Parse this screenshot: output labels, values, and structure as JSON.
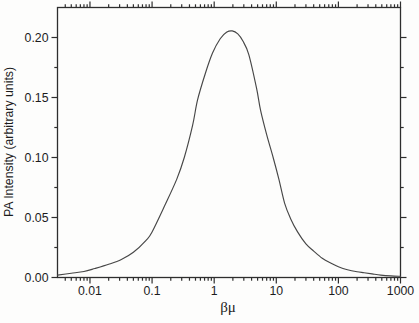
{
  "figure": {
    "background": "#fdfdfc",
    "axis_color": "#2e2e2e",
    "curve_color": "#474747",
    "text_color": "#1c1c1c"
  },
  "chart_data": {
    "type": "line",
    "title": "",
    "xlabel": "βμ",
    "ylabel": "PA Intensity (arbitrary units)",
    "x_scale": "log",
    "xlim": [
      0.003,
      1000
    ],
    "ylim": [
      0,
      0.225
    ],
    "grid": false,
    "legend": "none",
    "box_axes": true,
    "tick_direction": "out",
    "x_major_ticks": [
      0.01,
      0.1,
      1,
      10,
      100,
      1000
    ],
    "x_tick_labels": [
      "0.01",
      "0.1",
      "1",
      "10",
      "100",
      "1000"
    ],
    "y_major_ticks": [
      0,
      0.05,
      0.1,
      0.15,
      0.2
    ],
    "y_tick_labels": [
      "0.00",
      "0.05",
      "0.10",
      "0.15",
      "0.20"
    ],
    "y_minor_ticks": [
      0.025,
      0.075,
      0.125,
      0.175
    ],
    "peak": {
      "x": 1.9,
      "y": 0.205
    },
    "series": [
      {
        "name": "PA intensity",
        "points": [
          [
            0.003,
            0.002
          ],
          [
            0.005,
            0.0035
          ],
          [
            0.008,
            0.005
          ],
          [
            0.012,
            0.0075
          ],
          [
            0.02,
            0.011
          ],
          [
            0.032,
            0.015
          ],
          [
            0.05,
            0.021
          ],
          [
            0.08,
            0.031
          ],
          [
            0.1,
            0.038
          ],
          [
            0.16,
            0.06
          ],
          [
            0.25,
            0.082
          ],
          [
            0.33,
            0.1
          ],
          [
            0.45,
            0.127
          ],
          [
            0.54,
            0.148
          ],
          [
            0.72,
            0.17
          ],
          [
            0.94,
            0.187
          ],
          [
            1.25,
            0.199
          ],
          [
            1.6,
            0.2045
          ],
          [
            1.95,
            0.2055
          ],
          [
            2.4,
            0.203
          ],
          [
            2.9,
            0.197
          ],
          [
            3.6,
            0.186
          ],
          [
            4.8,
            0.158
          ],
          [
            5.6,
            0.139
          ],
          [
            7.0,
            0.119
          ],
          [
            8.9,
            0.1
          ],
          [
            11,
            0.082
          ],
          [
            13.6,
            0.062
          ],
          [
            17,
            0.049
          ],
          [
            22,
            0.038
          ],
          [
            30,
            0.028
          ],
          [
            40,
            0.022
          ],
          [
            55,
            0.016
          ],
          [
            75,
            0.012
          ],
          [
            100,
            0.009
          ],
          [
            140,
            0.0065
          ],
          [
            200,
            0.0048
          ],
          [
            260,
            0.004
          ],
          [
            350,
            0.003
          ],
          [
            480,
            0.002
          ],
          [
            700,
            0.0013
          ],
          [
            1000,
            0.001
          ]
        ]
      }
    ]
  }
}
